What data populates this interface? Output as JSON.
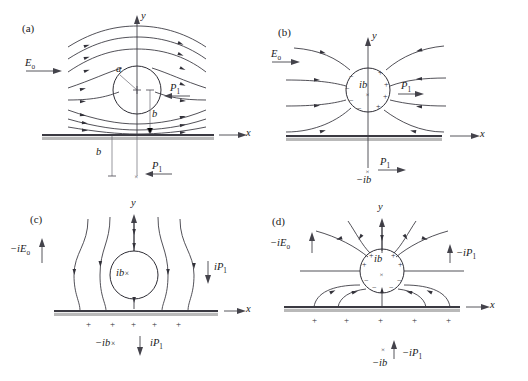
{
  "figure": {
    "type": "field-line-diagram-grid",
    "rows": 2,
    "columns": 2,
    "background": "#ffffff",
    "line_color": "#33323a",
    "ground_color": "#3b3a42"
  },
  "panels": [
    {
      "id": "a",
      "tag": "(a)",
      "axes": {
        "y_label": "y",
        "x_label": "x"
      },
      "field_label": "E",
      "field_sub": "o",
      "field_direction": "right",
      "circle_label": "",
      "radius_label": "a",
      "height_label": "b",
      "image_depth_label": "b",
      "dipole_label": "P",
      "dipole_sub": "1",
      "dipole_direction": "left",
      "image_dipole_label": "P",
      "image_dipole_sub": "1",
      "image_dipole_direction": "left",
      "ground_charges": [],
      "description": "Uniform horizontal field E_o flowing past a neutral conducting cylinder of radius a at height b above a ground plane; dipole P1 points left."
    },
    {
      "id": "b",
      "tag": "(b)",
      "axes": {
        "y_label": "y",
        "x_label": "x"
      },
      "field_label": "E",
      "field_sub": "o",
      "field_direction": "right",
      "circle_label": "ib",
      "circle_marker": "×",
      "circle_signs_left": [
        "−",
        "−",
        "−",
        "−"
      ],
      "circle_signs_right": [
        "+",
        "+",
        "+",
        "+"
      ],
      "dipole_label": "P",
      "dipole_sub": "1",
      "dipole_direction": "right",
      "image_label": "−ib",
      "image_marker": "×",
      "image_dipole_label": "P",
      "image_dipole_sub": "1",
      "image_dipole_direction": "right",
      "ground_charges": [],
      "description": "Line charge at ib with image −ib; radial field lines terminate on the ground plane; dipole P1 points right."
    },
    {
      "id": "c",
      "tag": "(c)",
      "axes": {
        "y_label": "y",
        "x_label": "x"
      },
      "field_label": "−iE",
      "field_sub": "o",
      "field_direction": "up",
      "circle_label": "ib",
      "circle_marker": "×",
      "dipole_label": "iP",
      "dipole_sub": "1",
      "dipole_direction": "down",
      "image_label": "−ib",
      "image_marker": "×",
      "image_dipole_label": "iP",
      "image_dipole_sub": "1",
      "image_dipole_direction": "down",
      "ground_charges": [
        "+",
        "+",
        "+",
        "+",
        "+"
      ],
      "description": "Vertical field −iE_o directed upward past the cylinder at ib; induced positive charges along the ground plane; dipole iP1 points down."
    },
    {
      "id": "d",
      "tag": "(d)",
      "axes": {
        "y_label": "y",
        "x_label": "x"
      },
      "field_label": "−iE",
      "field_sub": "o",
      "field_direction": "up",
      "circle_label": "ib",
      "circle_marker": "×",
      "circle_signs_top": [
        "+",
        "+",
        "+",
        "+"
      ],
      "circle_signs_bottom": [
        "−",
        "−",
        "−",
        "−"
      ],
      "dipole_label": "−iP",
      "dipole_sub": "1",
      "dipole_direction": "up",
      "image_label": "−ib",
      "image_marker": "×",
      "image_dipole_label": "−iP",
      "image_dipole_sub": "1",
      "image_dipole_direction": "up",
      "ground_charges": [
        "+",
        "+",
        "+",
        "+",
        "+"
      ],
      "description": "Vertical dipole field at ib with positive charges on the upper half of the cylinder and induced positive charge on the ground plane; dipole −iP1 points up."
    }
  ]
}
